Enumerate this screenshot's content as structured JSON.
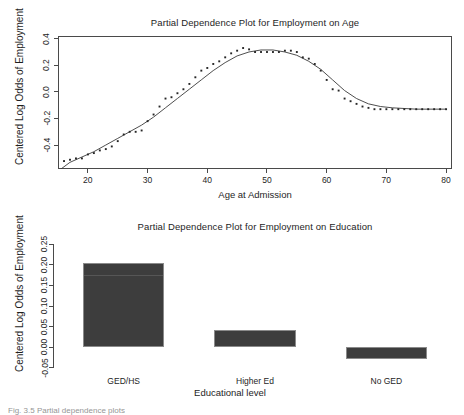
{
  "figure": {
    "background": "#ffffff",
    "ink_color": "#1e1e1e",
    "bar_color": "#3d3d3d",
    "axis_color": "#4a4a4a",
    "caption_fragment": "Fig. 3.5 Partial dependence plots"
  },
  "chart_data": [
    {
      "type": "scatter",
      "id": "employment-on-age",
      "title": "Partial Dependence Plot for Employment on Age",
      "xlabel": "Age at Admission",
      "ylabel": "Centered Log Odds of Employment",
      "xlim": [
        15,
        81
      ],
      "ylim": [
        -0.58,
        0.42
      ],
      "xticks": [
        20,
        30,
        40,
        50,
        60,
        70,
        80
      ],
      "xtick_labels": [
        "20",
        "30",
        "40",
        "50",
        "60",
        "70",
        "80"
      ],
      "yticks": [
        -0.4,
        -0.2,
        0.0,
        0.2,
        0.4
      ],
      "ytick_labels": [
        "-0.4",
        "-0.2",
        "0.0",
        "0.2",
        "0.4"
      ],
      "grid": false,
      "legend": null,
      "series": [
        {
          "name": "partial dependence points",
          "marker": "point",
          "x": [
            16,
            17,
            18,
            19,
            20,
            21,
            22,
            23,
            24,
            25,
            26,
            27,
            28,
            29,
            30,
            31,
            32,
            33,
            34,
            35,
            36,
            37,
            38,
            39,
            40,
            41,
            42,
            43,
            44,
            45,
            46,
            47,
            48,
            49,
            50,
            51,
            52,
            53,
            54,
            55,
            56,
            57,
            58,
            59,
            60,
            61,
            62,
            63,
            64,
            65,
            66,
            67,
            68,
            69,
            70,
            71,
            72,
            73,
            74,
            75,
            76,
            77,
            78,
            79,
            80
          ],
          "y": [
            -0.52,
            -0.51,
            -0.5,
            -0.5,
            -0.47,
            -0.46,
            -0.44,
            -0.43,
            -0.41,
            -0.37,
            -0.32,
            -0.3,
            -0.3,
            -0.29,
            -0.22,
            -0.17,
            -0.11,
            -0.05,
            -0.04,
            -0.01,
            0.02,
            0.06,
            0.11,
            0.16,
            0.18,
            0.21,
            0.23,
            0.26,
            0.29,
            0.31,
            0.33,
            0.32,
            0.3,
            0.3,
            0.3,
            0.3,
            0.3,
            0.31,
            0.31,
            0.3,
            0.26,
            0.25,
            0.21,
            0.16,
            0.09,
            0.02,
            0.01,
            -0.05,
            -0.07,
            -0.09,
            -0.11,
            -0.12,
            -0.13,
            -0.13,
            -0.13,
            -0.13,
            -0.13,
            -0.13,
            -0.13,
            -0.13,
            -0.13,
            -0.13,
            -0.13,
            -0.13,
            -0.13
          ]
        },
        {
          "name": "smoothed fit",
          "marker": "line",
          "x": [
            15.5,
            17,
            19,
            21,
            23,
            25,
            27,
            29,
            31,
            33,
            35,
            37,
            39,
            41,
            43,
            45,
            47,
            49,
            51,
            53,
            55,
            57,
            59,
            61,
            63,
            65,
            67,
            69,
            71,
            73,
            75,
            77,
            79,
            80
          ],
          "y": [
            -0.58,
            -0.53,
            -0.49,
            -0.45,
            -0.4,
            -0.35,
            -0.3,
            -0.25,
            -0.19,
            -0.12,
            -0.05,
            0.02,
            0.09,
            0.16,
            0.22,
            0.27,
            0.3,
            0.315,
            0.315,
            0.3,
            0.275,
            0.23,
            0.17,
            0.09,
            0.01,
            -0.05,
            -0.09,
            -0.11,
            -0.12,
            -0.125,
            -0.13,
            -0.13,
            -0.13,
            -0.13
          ]
        }
      ]
    },
    {
      "type": "bar",
      "id": "employment-on-education",
      "title": "Partial Dependence Plot for Employment on Education",
      "xlabel": "Educational level",
      "ylabel": "Centered Log Odds of Employment",
      "categories": [
        "GED/HS",
        "Higher Ed",
        "No GED"
      ],
      "values": [
        0.205,
        0.042,
        -0.028
      ],
      "ylim": [
        -0.06,
        0.26
      ],
      "yticks": [
        -0.05,
        0.0,
        0.05,
        0.1,
        0.15,
        0.2,
        0.25
      ],
      "ytick_labels": [
        "-0.05",
        "0.00",
        "0.05",
        "0.10",
        "0.15",
        "0.20",
        "0.25"
      ],
      "grid": false,
      "legend": null,
      "baseline": 0.0
    }
  ]
}
